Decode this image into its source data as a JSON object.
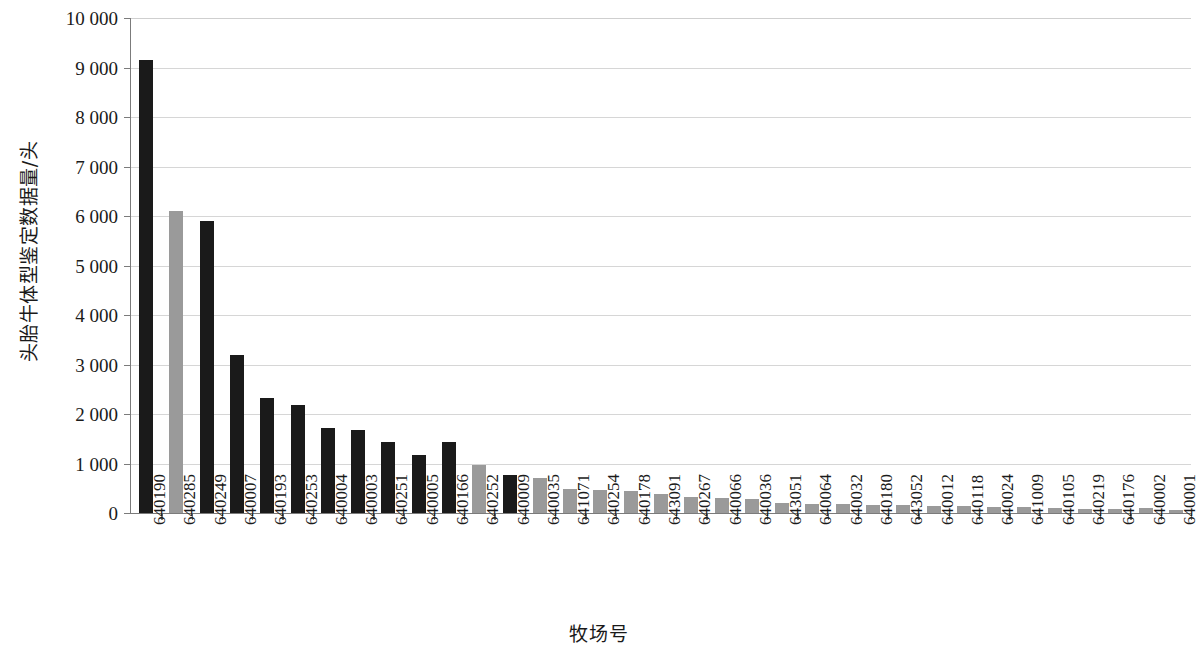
{
  "chart_data": {
    "type": "bar",
    "title": "",
    "xlabel": "牧场号",
    "ylabel": "头胎牛体型鉴定数据量/头",
    "ylim": [
      0,
      10000
    ],
    "xlim_categories": 35,
    "grid": "horizontal",
    "legend": "none",
    "y_tick_labels": [
      "10 000",
      "9 000",
      "8 000",
      "7 000",
      "6 000",
      "5 000",
      "4 000",
      "3 000",
      "2 000",
      "1 000",
      "0"
    ],
    "y_tick_values": [
      10000,
      9000,
      8000,
      7000,
      6000,
      5000,
      4000,
      3000,
      2000,
      1000,
      0
    ],
    "categories": [
      "640190",
      "640285",
      "640249",
      "640007",
      "640193",
      "640253",
      "640004",
      "640003",
      "640251",
      "640005",
      "640166",
      "640252",
      "640009",
      "640035",
      "641071",
      "640254",
      "640178",
      "643091",
      "640267",
      "640066",
      "640036",
      "643051",
      "640064",
      "640032",
      "640180",
      "643052",
      "640012",
      "640118",
      "640024",
      "641009",
      "640105",
      "640219",
      "640176",
      "640002",
      "640001"
    ],
    "values": [
      9150,
      6100,
      5900,
      3200,
      2320,
      2180,
      1720,
      1680,
      1440,
      1170,
      1430,
      960,
      760,
      710,
      490,
      470,
      450,
      390,
      320,
      300,
      280,
      210,
      190,
      180,
      170,
      160,
      150,
      140,
      130,
      120,
      110,
      90,
      85,
      100,
      60
    ],
    "bar_colors": [
      "#1a1a1a",
      "#9a9a9a",
      "#1a1a1a",
      "#1a1a1a",
      "#1a1a1a",
      "#1a1a1a",
      "#1a1a1a",
      "#1a1a1a",
      "#1a1a1a",
      "#1a1a1a",
      "#1a1a1a",
      "#9a9a9a",
      "#1a1a1a",
      "#9a9a9a",
      "#9a9a9a",
      "#9a9a9a",
      "#9a9a9a",
      "#9a9a9a",
      "#9a9a9a",
      "#9a9a9a",
      "#9a9a9a",
      "#9a9a9a",
      "#9a9a9a",
      "#9a9a9a",
      "#9a9a9a",
      "#9a9a9a",
      "#9a9a9a",
      "#9a9a9a",
      "#9a9a9a",
      "#9a9a9a",
      "#9a9a9a",
      "#9a9a9a",
      "#9a9a9a",
      "#9a9a9a",
      "#9a9a9a"
    ],
    "colors": {
      "bar_dark": "#1a1a1a",
      "bar_light": "#9a9a9a",
      "gridline": "#d6d6d6",
      "axis": "#7b7b7b",
      "background": "#ffffff",
      "text": "#1a1a1a"
    }
  }
}
